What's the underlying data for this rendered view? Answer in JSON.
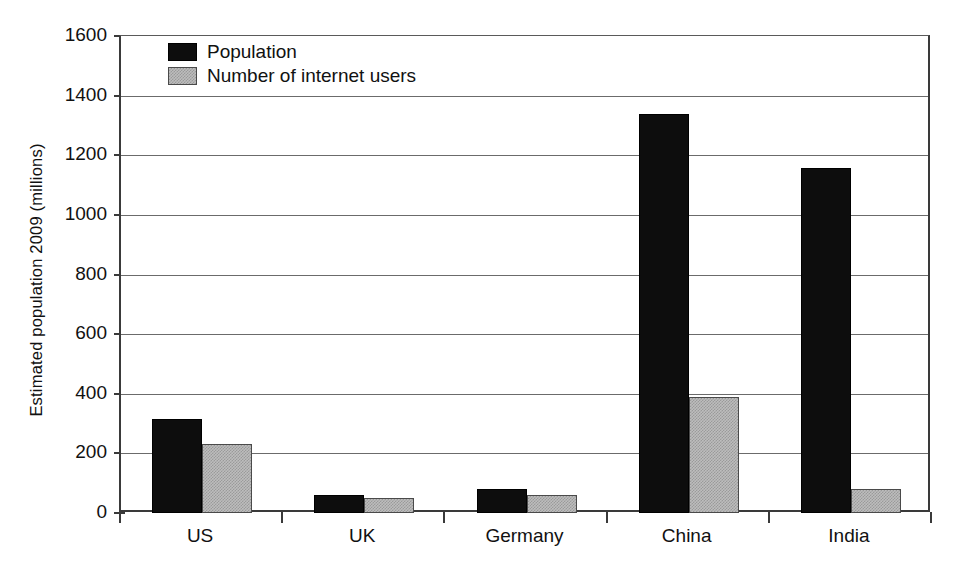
{
  "chart_data": {
    "type": "bar",
    "title": "",
    "subtitle": "",
    "xlabel": "",
    "ylabel": "Estimated population 2009 (millions)",
    "categories": [
      "US",
      "UK",
      "Germany",
      "China",
      "India"
    ],
    "series": [
      {
        "name": "Population",
        "values": [
          314,
          61,
          82,
          1338,
          1156
        ],
        "color": "#0d0d0d"
      },
      {
        "name": "Number of internet users",
        "values": [
          231,
          49,
          62,
          389,
          81
        ],
        "color": "#bdbdbd"
      }
    ],
    "ylim": [
      0,
      1600
    ],
    "ytick_step": 200,
    "yticks": [
      0,
      200,
      400,
      600,
      800,
      1000,
      1200,
      1400,
      1600
    ],
    "ytick_labels": [
      "0",
      "200",
      "400",
      "600",
      "800",
      "1000",
      "1200",
      "1400",
      "1600"
    ],
    "grid": "horizontal",
    "legend_position": "top-left-inside",
    "legend_entries": [
      "Population",
      "Number of internet users"
    ]
  },
  "axes": {
    "y_title": "Estimated population 2009 (millions)"
  }
}
